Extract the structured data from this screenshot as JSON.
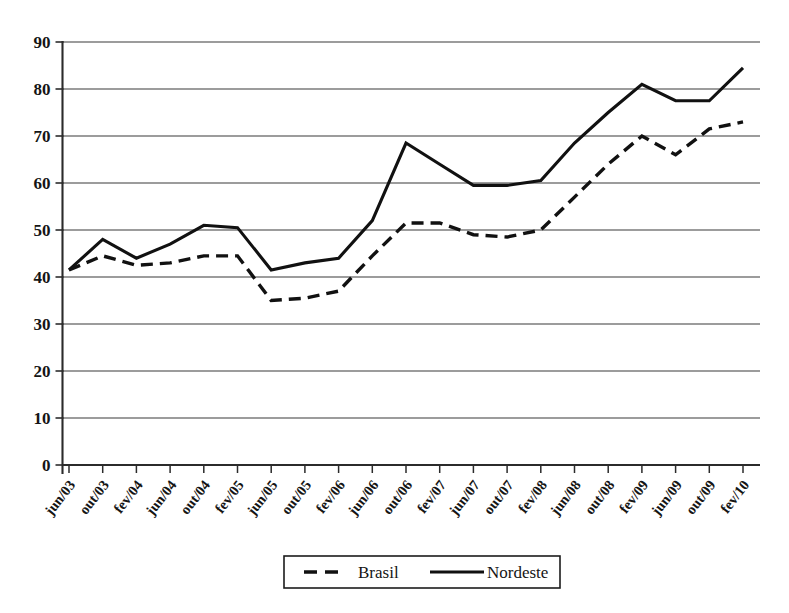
{
  "chart_data": {
    "type": "line",
    "title": "",
    "subtitle": "",
    "xlabel": "",
    "ylabel": "",
    "ylim": [
      0,
      90
    ],
    "ytick_step": 10,
    "yticks": [
      "0",
      "10",
      "20",
      "30",
      "40",
      "50",
      "60",
      "70",
      "80",
      "90"
    ],
    "grid": true,
    "legend_position": "bottom-center",
    "x": [
      "jun/03",
      "out/03",
      "fev/04",
      "jun/04",
      "out/04",
      "fev/05",
      "jun/05",
      "out/05",
      "fev/06",
      "jun/06",
      "out/06",
      "fev/07",
      "jun/07",
      "out/07",
      "fev/08",
      "jun/08",
      "out/08",
      "fev/09",
      "jun/09",
      "out/09",
      "fev/10"
    ],
    "series": [
      {
        "name": "Brasil",
        "style": "dashed",
        "color": "#111111",
        "values": [
          41.5,
          44.5,
          42.5,
          43.0,
          44.5,
          44.5,
          35.0,
          35.5,
          37.0,
          44.5,
          51.5,
          51.5,
          49.0,
          48.5,
          50.0,
          57.0,
          64.0,
          70.0,
          66.0,
          71.5,
          73.0
        ]
      },
      {
        "name": "Nordeste",
        "style": "solid",
        "color": "#111111",
        "values": [
          41.5,
          48.0,
          44.0,
          47.0,
          51.0,
          50.5,
          41.5,
          43.0,
          44.0,
          52.0,
          68.5,
          64.0,
          59.5,
          59.5,
          60.5,
          68.5,
          75.0,
          81.0,
          77.5,
          77.5,
          84.5
        ]
      }
    ],
    "legend": [
      {
        "label": "Brasil",
        "style": "dashed"
      },
      {
        "label": "Nordeste",
        "style": "solid"
      }
    ]
  }
}
